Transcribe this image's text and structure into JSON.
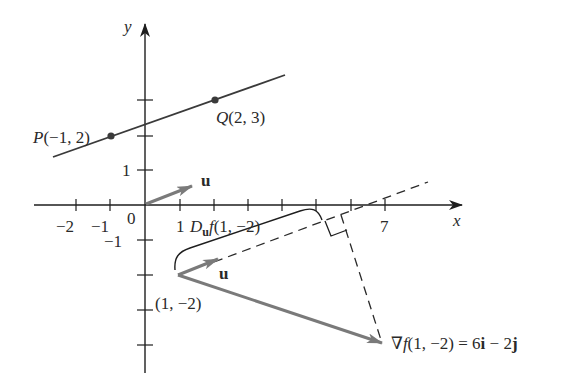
{
  "figure": {
    "type": "directional-derivative-diagram",
    "axes": {
      "x_label": "x",
      "y_label": "y",
      "x_tick_labels": [
        {
          "value": -2,
          "text": "−2"
        },
        {
          "value": -1,
          "text": "−1"
        },
        {
          "value": 0,
          "text": "0"
        },
        {
          "value": 1,
          "text": "1"
        },
        {
          "value": 7,
          "text": "7"
        }
      ],
      "y_tick_labels": [
        {
          "value": 1,
          "text": "1"
        },
        {
          "value": -1,
          "text": "−1"
        }
      ],
      "x_ticks": [
        -2,
        -1,
        1,
        2,
        3,
        4,
        5,
        6,
        7
      ],
      "y_ticks": [
        3,
        2,
        1,
        -1,
        -2,
        -3,
        -4
      ]
    },
    "points": {
      "P": {
        "label_name": "P",
        "label_coords": "(−1, 2)",
        "x": -1,
        "y": 2
      },
      "Q": {
        "label_name": "Q",
        "label_coords": "(2, 3)",
        "x": 2,
        "y": 3
      },
      "base": {
        "label": "(1, −2)",
        "x": 1,
        "y": -2
      }
    },
    "vectors": {
      "u_origin_label": "u",
      "u_base_label": "u",
      "gradient_label_prefix": "∇",
      "gradient_label_f": "f",
      "gradient_label_rest": "(1, −2) = 6",
      "gradient_i": "i",
      "gradient_minus": " − 2",
      "gradient_j": "j"
    },
    "projection": {
      "label_D": "D",
      "label_sub": "u",
      "label_f": "f",
      "label_args": "(1, −2)"
    },
    "colors": {
      "axis": "#1e1e1e",
      "vector": "#7a7a7a",
      "line": "#3a3a3a",
      "dashed": "#2a2a2a",
      "point": "#3a3a3a"
    }
  }
}
